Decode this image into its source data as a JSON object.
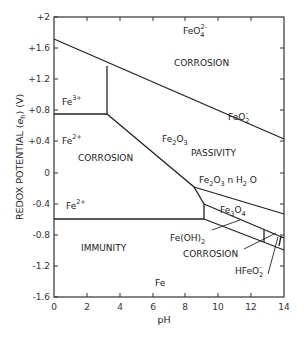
{
  "diagram": {
    "type": "pourbaix",
    "title": "",
    "xlabel": "pH",
    "ylabel": "REDOX  POTENTIAL (e_h) (V)",
    "ylabel_parts": {
      "main": "REDOX  POTENTIAL (",
      "e": "e",
      "sub": "h",
      "tail": ") (V)"
    },
    "x_ticks": [
      "0",
      "2",
      "4",
      "6",
      "8",
      "10",
      "12",
      "14"
    ],
    "y_ticks": [
      "+2",
      "+1.6",
      "+1.2",
      "+0.8",
      "+0.4",
      "0",
      "-0.4",
      "-0.8",
      "-1.2",
      "-1.6"
    ],
    "xlim": [
      0,
      14
    ],
    "ylim": [
      -1.6,
      2
    ],
    "regions": {
      "feo4": {
        "base": "FeO",
        "sub": "4",
        "sup": "2-"
      },
      "corrosion_top": "CORROSION",
      "feo2": {
        "base": "FeO",
        "sub": "2",
        "sup": "-"
      },
      "fe3": {
        "base": "Fe",
        "sup": "3+"
      },
      "fe2_upper": {
        "base": "Fe",
        "sup": "2+"
      },
      "corrosion_left": "CORROSION",
      "fe2o3": {
        "a": "Fe",
        "s1": "2",
        "b": "O",
        "s2": "3"
      },
      "passivity": "PASSIVITY",
      "fe2o3_nh2o": {
        "a": "Fe",
        "s1": "2",
        "b": "O",
        "s2": "3",
        "c": " n H",
        "s3": "2",
        "d": " O"
      },
      "fe3o4": {
        "a": "Fe",
        "s1": "3",
        "b": "O",
        "s2": "4"
      },
      "fe2_lower": {
        "base": "Fe",
        "sup": "2+"
      },
      "feoh2": {
        "a": "Fe(OH)",
        "s1": "2"
      },
      "corrosion_right": "CORROSION",
      "hfeo2": {
        "a": "HFeO",
        "sub": "2",
        "sup": "-"
      },
      "immunity": "IMMUNITY",
      "fe": "Fe"
    }
  }
}
